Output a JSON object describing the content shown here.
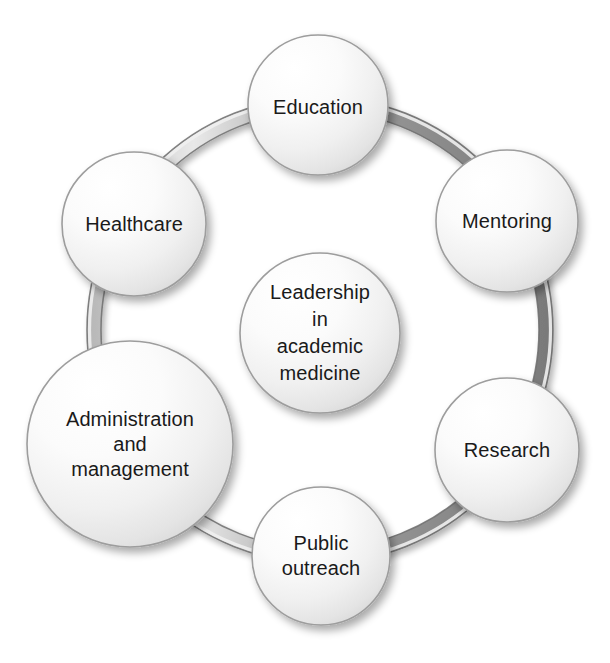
{
  "diagram": {
    "type": "circular-cluster-diagram",
    "background_color": "#ffffff",
    "ring": {
      "name": "connector-ring",
      "shape": "torus-band",
      "band_color": "#8e8e8e",
      "band_highlight_color": "#d7d7d7",
      "band_outline_color": "#5b5b5b",
      "center_x": 320,
      "center_y": 330,
      "radius": 226,
      "band_width": 13
    },
    "center_node": {
      "id": "center",
      "label": "Leadership\nin\nacademic\nmedicine",
      "lines": [
        "Leadership",
        "in",
        "academic",
        "medicine"
      ],
      "cx": 320,
      "cy": 333,
      "r": 80,
      "font_size": 20
    },
    "nodes": [
      {
        "id": "education",
        "label": "Education",
        "cx": 318,
        "cy": 105,
        "r": 70,
        "font_size": 20,
        "label_dy": 2
      },
      {
        "id": "mentoring",
        "label": "Mentoring",
        "cx": 507,
        "cy": 221,
        "r": 71,
        "font_size": 20,
        "label_dy": 0
      },
      {
        "id": "research",
        "label": "Research",
        "cx": 507,
        "cy": 450,
        "r": 72,
        "font_size": 20,
        "label_dy": 0
      },
      {
        "id": "public-outreach",
        "label": "Public\noutreach",
        "cx": 321,
        "cy": 556,
        "r": 69,
        "font_size": 20,
        "label_dy": 0
      },
      {
        "id": "administration-and-management",
        "label": "Administration\nand\nmanagement",
        "cx": 130,
        "cy": 444,
        "r": 103,
        "font_size": 20,
        "label_dy": 0
      },
      {
        "id": "healthcare",
        "label": "Healthcare",
        "cx": 134,
        "cy": 224,
        "r": 72,
        "font_size": 20,
        "label_dy": 0
      }
    ],
    "node_style": {
      "fill_light": "#ffffff",
      "fill_mid": "#f2f2f2",
      "fill_dark": "#dcdcdc",
      "stroke": "#9a9a9a",
      "text_color": "#1a1a1a"
    }
  }
}
